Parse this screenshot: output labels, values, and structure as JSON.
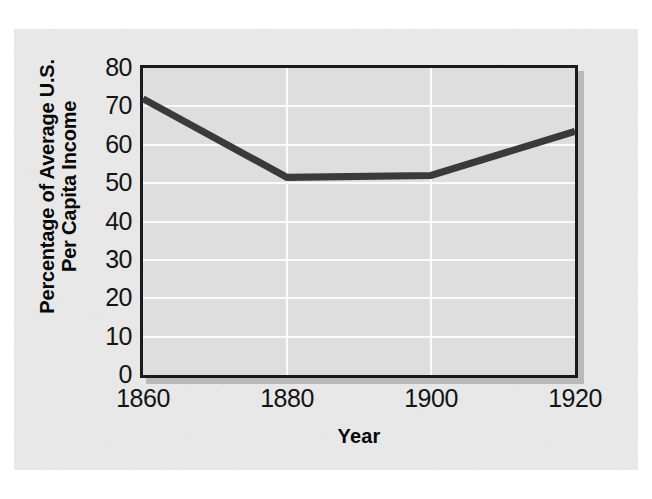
{
  "chart_data": {
    "type": "line",
    "title": "",
    "subtitle": "",
    "xlabel": "Year",
    "ylabel": "Percentage of Average U.S. Per Capita Income",
    "ylabel_line1": "Percentage of Average U.S.",
    "ylabel_line2": "Per Capita Income",
    "x": [
      1860,
      1880,
      1900,
      1920
    ],
    "values": [
      72,
      51.5,
      52,
      63.5
    ],
    "series": [
      {
        "name": "Percentage of Average U.S. Per Capita Income",
        "values": [
          72,
          51.5,
          52,
          63.5
        ]
      }
    ],
    "xlim": [
      1860,
      1920
    ],
    "ylim": [
      0,
      80
    ],
    "xticks": [
      1860,
      1880,
      1900,
      1920
    ],
    "xtick_labels": [
      "1860",
      "1880",
      "1900",
      "1920"
    ],
    "yticks": [
      0,
      10,
      20,
      30,
      40,
      50,
      60,
      70,
      80
    ],
    "ytick_labels": [
      "0",
      "10",
      "20",
      "30",
      "40",
      "50",
      "60",
      "70",
      "80"
    ],
    "grid": true,
    "grid_orientation": "both",
    "grid_color": "#fbfbfb",
    "legend": false,
    "legend_position": "none",
    "annotations": []
  },
  "style": {
    "page_background": "#ffffff",
    "figure_background": "#e9e9e9",
    "plot_background": "#dedede",
    "axis_color": "#1a1a1a",
    "line_color": "#3a3a3a",
    "shadow_color": "#b9b9b9",
    "text_color": "#141414"
  }
}
